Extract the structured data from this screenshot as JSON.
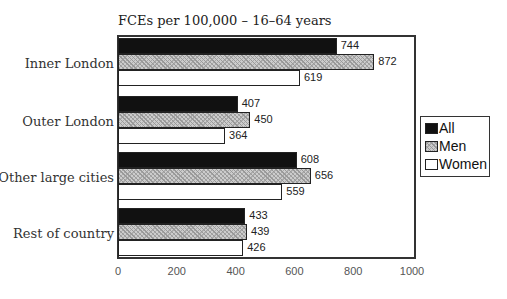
{
  "chart_data": {
    "type": "bar",
    "orientation": "horizontal",
    "title": "FCEs per 100,000 – 16–64 years",
    "categories": [
      "Inner London",
      "Outer London",
      "Other large cities",
      "Rest of country"
    ],
    "series": [
      {
        "name": "All",
        "values": [
          744,
          407,
          608,
          433
        ],
        "fill": "#111111"
      },
      {
        "name": "Men",
        "values": [
          872,
          450,
          656,
          439
        ],
        "fill": "hatched-grey"
      },
      {
        "name": "Women",
        "values": [
          619,
          364,
          559,
          426
        ],
        "fill": "#ffffff"
      }
    ],
    "xlabel": "",
    "ylabel": "",
    "xlim": [
      0,
      1000
    ],
    "xticks": [
      "0",
      "200",
      "400",
      "600",
      "800",
      "1000"
    ],
    "grid": false,
    "legend_position": "right",
    "data_labels": true
  },
  "legend": {
    "items": [
      "All",
      "Men",
      "Women"
    ]
  }
}
